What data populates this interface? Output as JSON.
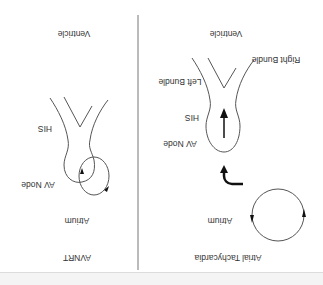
{
  "diagram": {
    "orientation": "rotated-180",
    "panels": [
      {
        "id": "avnrt",
        "title": "AVNRT",
        "labels": {
          "ventricle": "Ventricle",
          "his": "HIS",
          "av_node": "AV Node",
          "atrium": "Atrium"
        }
      },
      {
        "id": "atrial-tachycardia",
        "title": "Atrial Tachycardia",
        "labels": {
          "ventricle": "Ventricle",
          "right_bundle": "Right Bundle",
          "left_bundle": "Left Bundle",
          "his": "HIS",
          "av_node": "AV Node",
          "atrium": "Atrium"
        }
      }
    ],
    "colors": {
      "line": "#555555",
      "arrow": "#111111",
      "text": "#333333",
      "divider": "#777777"
    }
  }
}
